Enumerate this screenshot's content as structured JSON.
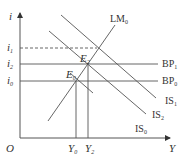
{
  "diagram": {
    "type": "IS-LM-BP",
    "axes": {
      "y_label": "i",
      "x_label": "Y",
      "origin_label": "O"
    },
    "interest_rates": [
      {
        "name": "i",
        "sub": "1",
        "style": "dashed"
      },
      {
        "name": "i",
        "sub": "2",
        "style": "solid"
      },
      {
        "name": "i",
        "sub": "0",
        "style": "solid"
      }
    ],
    "incomes": [
      {
        "name": "Y",
        "sub": "0"
      },
      {
        "name": "Y",
        "sub": "2"
      }
    ],
    "curves": {
      "lm": {
        "name": "LM",
        "sub": "0"
      },
      "bp1": {
        "name": "BP",
        "sub": "1"
      },
      "bp0": {
        "name": "BP",
        "sub": "0"
      },
      "is1": {
        "name": "IS",
        "sub": "1"
      },
      "is2": {
        "name": "IS",
        "sub": "2"
      },
      "is0": {
        "name": "IS",
        "sub": "0"
      }
    },
    "points": {
      "e0": {
        "name": "E",
        "sub": "0"
      },
      "e2": {
        "name": "E",
        "sub": "2"
      }
    },
    "line_color": "#555555"
  }
}
